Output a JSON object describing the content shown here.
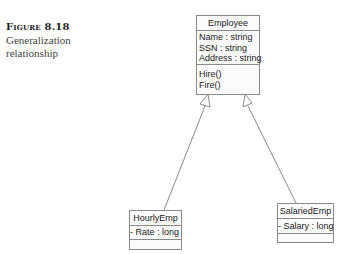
{
  "caption": {
    "figure_number": "Figure 8.18",
    "description_line1": "Generalization",
    "description_line2": "relationship"
  },
  "classes": {
    "employee": {
      "name": "Employee",
      "attributes": [
        "Name : string",
        "SSN : string",
        "Address : string"
      ],
      "operations": [
        "Hire()",
        "Fire()"
      ]
    },
    "hourly": {
      "name": "HourlyEmp",
      "attributes": [
        "- Rate : long"
      ],
      "operations": []
    },
    "salaried": {
      "name": "SalariedEmp",
      "attributes": [
        "- Salary : long"
      ],
      "operations": []
    }
  },
  "relationships": [
    {
      "type": "generalization",
      "from": "HourlyEmp",
      "to": "Employee"
    },
    {
      "type": "generalization",
      "from": "SalariedEmp",
      "to": "Employee"
    }
  ],
  "colors": {
    "line": "#8a8a8a",
    "box_border": "#8a8a8a",
    "text": "#222222"
  }
}
